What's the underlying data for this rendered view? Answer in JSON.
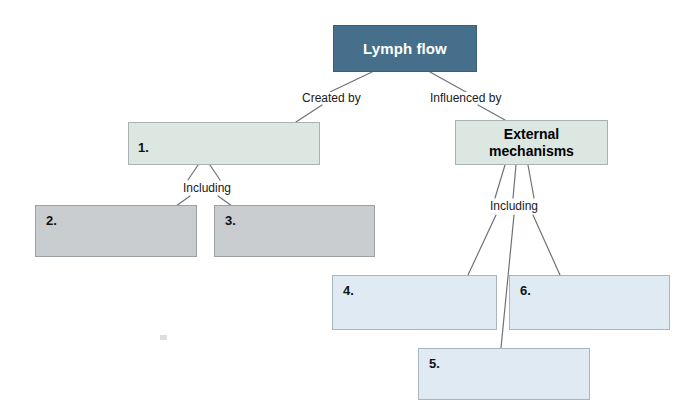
{
  "diagram": {
    "type": "concept-map-worksheet",
    "colors": {
      "root_fill": "#456f8a",
      "root_text": "#ffffff",
      "green_fill": "#dde7e2",
      "grey_fill": "#c9cdd0",
      "blue_fill": "#e0eaf2",
      "line": "#6b7378",
      "border": "#9aa3a8"
    },
    "nodes": {
      "root": {
        "label": "Lymph flow"
      },
      "box1": {
        "number": "1."
      },
      "external": {
        "label": "External\nmechanisms",
        "line1": "External",
        "line2": "mechanisms"
      },
      "box2": {
        "number": "2."
      },
      "box3": {
        "number": "3."
      },
      "box4": {
        "number": "4."
      },
      "box5": {
        "number": "5."
      },
      "box6": {
        "number": "6."
      }
    },
    "edge_labels": {
      "created_by": "Created by",
      "influenced_by": "Influenced by",
      "including_left": "Including",
      "including_right": "Including"
    }
  }
}
